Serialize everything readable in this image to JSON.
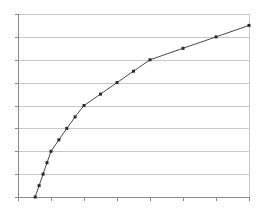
{
  "chart_data": {
    "type": "line",
    "title": "",
    "xlabel": "",
    "ylabel": "",
    "xlim": [
      0,
      7
    ],
    "ylim": [
      0,
      8
    ],
    "x_ticks": [
      0,
      1,
      2,
      3,
      4,
      5,
      6,
      7
    ],
    "y_ticks": [
      0,
      1,
      2,
      3,
      4,
      5,
      6,
      7,
      8
    ],
    "tick_labels_visible": false,
    "grid": {
      "horizontal": true,
      "vertical": false
    },
    "legend": null,
    "series": [
      {
        "name": "Series 1",
        "color": "#4a4a4a",
        "marker": "square",
        "x": [
          0.52,
          0.64,
          0.76,
          0.88,
          1.0,
          1.24,
          1.48,
          1.73,
          2.0,
          2.5,
          3.0,
          3.5,
          4.0,
          5.0,
          6.0,
          7.0
        ],
        "y": [
          0,
          0.5,
          1.0,
          1.5,
          2.0,
          2.5,
          3.0,
          3.5,
          4.0,
          4.5,
          5.0,
          5.5,
          6.0,
          6.5,
          7.0,
          7.5
        ]
      }
    ]
  },
  "layout": {
    "plot": {
      "left": 18,
      "top": 14,
      "right": 249,
      "bottom": 197
    },
    "colors": {
      "grid": "#c8c8c8",
      "axis": "#8a8a8a",
      "line": "#4a4a4a",
      "marker": "#2a2a2a"
    }
  }
}
